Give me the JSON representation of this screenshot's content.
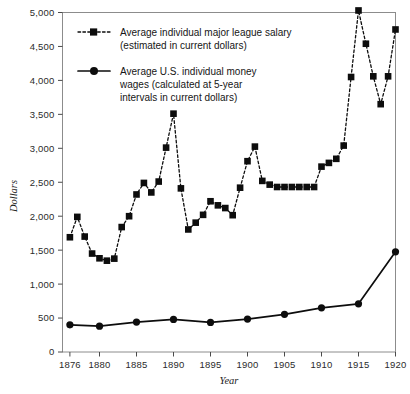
{
  "chart_data": {
    "type": "line",
    "title": "",
    "xlabel": "Year",
    "ylabel": "Dollars",
    "xlim": [
      1875,
      1920
    ],
    "ylim": [
      0,
      5000
    ],
    "grid": false,
    "legend_position": "upper-left-inside",
    "x_ticks": [
      1876,
      1880,
      1885,
      1890,
      1895,
      1900,
      1905,
      1910,
      1915,
      1920
    ],
    "x_tick_labels": [
      "1876",
      "1880",
      "1885",
      "1890",
      "1895",
      "1900",
      "1905",
      "1910",
      "1915",
      "1920"
    ],
    "y_ticks": [
      0,
      500,
      1000,
      1500,
      2000,
      2500,
      3000,
      3500,
      4000,
      4500,
      5000
    ],
    "y_tick_labels": [
      "0",
      "500",
      "1,000",
      "1,500",
      "2,000",
      "2,500",
      "3,000",
      "3,500",
      "4,000",
      "4,500",
      "5,000"
    ],
    "series": [
      {
        "name": "Average individual major league salary (estimated in current dollars)",
        "legend_line1": "Average individual major league salary",
        "legend_line2": "(estimated in current dollars)",
        "style": "dashed",
        "marker": "square",
        "color": "#0d0d0d",
        "x": [
          1876,
          1877,
          1878,
          1879,
          1880,
          1881,
          1882,
          1883,
          1884,
          1885,
          1886,
          1887,
          1888,
          1889,
          1890,
          1891,
          1892,
          1893,
          1894,
          1895,
          1896,
          1897,
          1898,
          1899,
          1900,
          1901,
          1902,
          1903,
          1904,
          1905,
          1906,
          1907,
          1908,
          1909,
          1910,
          1911,
          1912,
          1913,
          1914,
          1915,
          1916,
          1917,
          1918,
          1919,
          1920
        ],
        "values": [
          1690,
          1990,
          1700,
          1450,
          1380,
          1345,
          1375,
          1840,
          2000,
          2320,
          2490,
          2350,
          2510,
          3010,
          3510,
          2410,
          1805,
          1905,
          2020,
          2220,
          2160,
          2120,
          2015,
          2420,
          2810,
          3025,
          2520,
          2465,
          2430,
          2430,
          2430,
          2430,
          2430,
          2430,
          2730,
          2785,
          2845,
          3040,
          4050,
          5030,
          4540,
          4060,
          3650,
          4060,
          4750
        ]
      },
      {
        "name": "Average U.S. individual money wages (calculated at 5-year intervals in current dollars)",
        "legend_line1": "Average U.S. individual money",
        "legend_line2": "wages (calculated at 5-year",
        "legend_line3": "intervals in current dollars)",
        "style": "solid",
        "marker": "circle",
        "color": "#0d0d0d",
        "x": [
          1876,
          1880,
          1885,
          1890,
          1895,
          1900,
          1905,
          1910,
          1915,
          1920
        ],
        "values": [
          400,
          380,
          440,
          480,
          435,
          485,
          555,
          650,
          710,
          1475
        ]
      }
    ]
  }
}
